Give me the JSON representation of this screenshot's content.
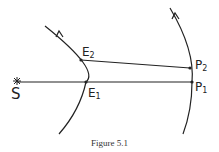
{
  "diagram": {
    "caption": "Figure 5.1",
    "labels": {
      "sun": "S",
      "E2_main": "E",
      "E2_sub": "2",
      "E1_main": "E",
      "E1_sub": "1",
      "P2_main": "P",
      "P2_sub": "2",
      "P1_main": "P",
      "P1_sub": "1"
    },
    "points": {
      "S": [
        17,
        81
      ],
      "E1": [
        86,
        82
      ],
      "E2": [
        81,
        60
      ],
      "P1": [
        192,
        82
      ],
      "P2": [
        190,
        68
      ]
    },
    "stroke_color": "#222222"
  }
}
